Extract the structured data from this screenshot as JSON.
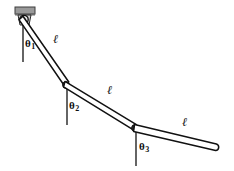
{
  "figure": {
    "type": "triple-pendulum-diagram",
    "background_color": "#ffffff",
    "stroke_color": "#111111",
    "mount_color": "#9a9a9a",
    "mount_edge_color": "#4a4a4a"
  },
  "labels": {
    "theta1": "θ",
    "theta1_sub": "1",
    "theta2": "θ",
    "theta2_sub": "2",
    "theta3": "θ",
    "theta3_sub": "3",
    "length1": "ℓ",
    "length2": "ℓ",
    "length3": "ℓ"
  },
  "geometry": {
    "pivot": {
      "x": 24,
      "y": 19
    },
    "joint2": {
      "x": 66,
      "y": 85
    },
    "joint3": {
      "x": 135,
      "y": 128
    },
    "tip": {
      "x": 217,
      "y": 150
    },
    "vertical_ref_1": {
      "x": 23,
      "y_top": 21,
      "y_bottom": 62
    },
    "vertical_ref_2": {
      "x": 67,
      "y_top": 87,
      "y_bottom": 125
    },
    "vertical_ref_3": {
      "x": 136,
      "y_top": 130,
      "y_bottom": 166
    },
    "mount_block": {
      "x": 15,
      "y": 7,
      "width": 20,
      "height": 7
    }
  }
}
